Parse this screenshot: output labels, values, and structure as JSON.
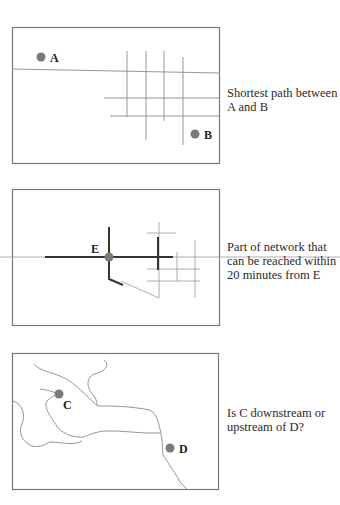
{
  "figure": {
    "panels": [
      {
        "id": "shortest-path",
        "caption": "Shortest path between\nA and B",
        "points": [
          {
            "label": "A"
          },
          {
            "label": "B"
          }
        ]
      },
      {
        "id": "reachability",
        "caption": "Part of network that\ncan be reached within\n20 minutes from E",
        "points": [
          {
            "label": "E"
          }
        ]
      },
      {
        "id": "river-flow",
        "caption": "Is C downstream or\nupstream of D?",
        "points": [
          {
            "label": "C"
          },
          {
            "label": "D"
          }
        ]
      }
    ],
    "colors": {
      "frame": "#777777",
      "thin_line": "#8a8a8a",
      "thick_line": "#333333",
      "point_fill": "#7a7a7a",
      "text": "#222222"
    }
  }
}
